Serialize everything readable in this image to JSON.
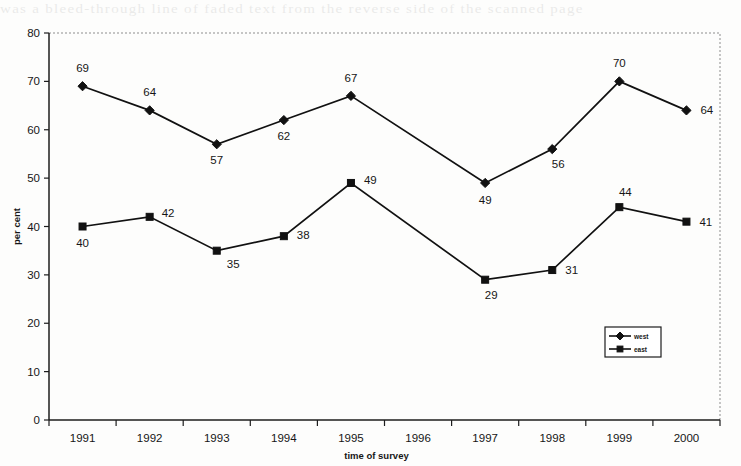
{
  "page": {
    "ghost_text": "was a bleed-through line of faded text from the reverse side of the scanned page"
  },
  "chart_data": {
    "type": "line",
    "title": "",
    "xlabel": "time of survey",
    "ylabel": "per cent",
    "categories": [
      "1991",
      "1992",
      "1993",
      "1994",
      "1995",
      "1996",
      "1997",
      "1998",
      "1999",
      "2000"
    ],
    "ylim": [
      0,
      80
    ],
    "yticks": [
      0,
      10,
      20,
      30,
      40,
      50,
      60,
      70,
      80
    ],
    "grid": false,
    "legend_position": "inside-bottom-right",
    "series": [
      {
        "name": "west",
        "marker": "diamond",
        "color": "#111111",
        "values": [
          69,
          64,
          57,
          62,
          67,
          null,
          49,
          56,
          70,
          64
        ],
        "labels": [
          "69",
          "64",
          "57",
          "62",
          "67",
          "",
          "49",
          "56",
          "70",
          "64"
        ]
      },
      {
        "name": "east",
        "marker": "square",
        "color": "#111111",
        "values": [
          40,
          42,
          35,
          38,
          49,
          null,
          29,
          31,
          44,
          41
        ],
        "labels": [
          "40",
          "42",
          "35",
          "38",
          "49",
          "",
          "29",
          "31",
          "44",
          "41"
        ]
      }
    ]
  },
  "legend": {
    "items": [
      {
        "label": "west",
        "marker": "diamond"
      },
      {
        "label": "east",
        "marker": "square"
      }
    ]
  }
}
